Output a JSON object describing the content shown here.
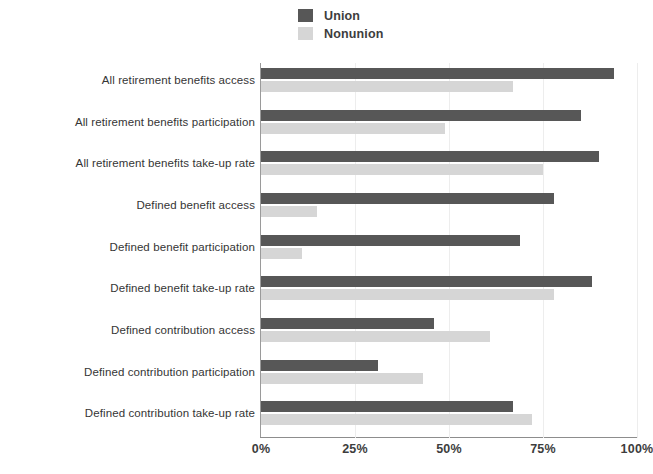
{
  "chart_data": {
    "type": "bar",
    "orientation": "horizontal",
    "title": "",
    "subtitle": "",
    "xlabel": "",
    "ylabel": "",
    "xlim": [
      0,
      100
    ],
    "x_tick_labels": [
      "0%",
      "25%",
      "50%",
      "75%",
      "100%"
    ],
    "x_tick_values": [
      0,
      25,
      50,
      75,
      100
    ],
    "grid": true,
    "grid_axis": "x",
    "legend_position": "top-center",
    "categories": [
      "All retirement benefits access",
      "All retirement benefits participation",
      "All retirement benefits take-up rate",
      "Defined benefit access",
      "Defined benefit participation",
      "Defined benefit take-up rate",
      "Defined contribution access",
      "Defined contribution participation",
      "Defined contribution take-up rate"
    ],
    "series": [
      {
        "name": "Union",
        "color": "#575757",
        "values": [
          94,
          85,
          90,
          78,
          69,
          88,
          46,
          31,
          67
        ]
      },
      {
        "name": "Nonunion",
        "color": "#d6d6d6",
        "values": [
          67,
          49,
          75,
          15,
          11,
          78,
          61,
          43,
          72
        ]
      }
    ]
  },
  "legend": {
    "items": [
      {
        "label": "Union",
        "color": "#575757"
      },
      {
        "label": "Nonunion",
        "color": "#d6d6d6"
      }
    ]
  },
  "axis": {
    "x_labels": [
      "0%",
      "25%",
      "50%",
      "75%",
      "100%"
    ]
  }
}
